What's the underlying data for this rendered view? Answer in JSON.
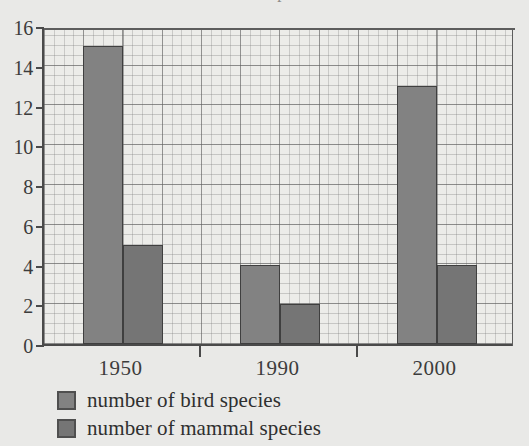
{
  "page": {
    "cropped_top_text": "shows the number of bird and mammal species",
    "background_color": "#e9e9e7"
  },
  "chart_data": {
    "type": "bar",
    "title": "",
    "xlabel": "",
    "ylabel": "",
    "categories": [
      "1950",
      "1990",
      "2000"
    ],
    "series": [
      {
        "name": "number of bird species",
        "values": [
          15,
          4,
          13
        ],
        "color": "#828282"
      },
      {
        "name": "number of mammal species",
        "values": [
          5,
          2,
          4
        ],
        "color": "#757575"
      }
    ],
    "ylim": [
      0,
      16
    ],
    "ytick_values": [
      0,
      2,
      4,
      6,
      8,
      10,
      12,
      14,
      16
    ],
    "ytick_labels": [
      "0",
      "2",
      "4",
      "6",
      "8",
      "10",
      "12",
      "14",
      "16"
    ],
    "minor_grid_step": 0.5,
    "grid": true,
    "grid_style": "graph-paper",
    "legend_position": "bottom-left",
    "axis_color": "#4a4a4a",
    "plot_background": "#ecece9"
  }
}
